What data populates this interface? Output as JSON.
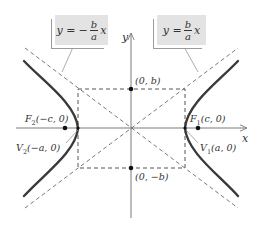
{
  "diagram": {
    "axes": {
      "x_label": "x",
      "y_label": "y"
    },
    "asymptote_labels": {
      "left": {
        "lhs": "y =",
        "sign": "−",
        "numerator": "b",
        "denominator": "a",
        "var": "x"
      },
      "right": {
        "lhs": "y =",
        "sign": "",
        "numerator": "b",
        "denominator": "a",
        "var": "x"
      }
    },
    "points": {
      "co_vertex_top": "(0, b)",
      "co_vertex_bottom": "(0, −b)",
      "focus_right": {
        "name": "F",
        "sub": "1",
        "coords": "(c, 0)"
      },
      "focus_left": {
        "name": "F",
        "sub": "2",
        "coords": "(−c, 0)"
      },
      "vertex_right": {
        "name": "V",
        "sub": "1",
        "coords": "(a, 0)"
      },
      "vertex_left": {
        "name": "V",
        "sub": "2",
        "coords": "(−a, 0)"
      }
    },
    "colors": {
      "curve": "#3a3a3a",
      "axis": "#7a7a7a",
      "dashed": "#555555",
      "box_fill": "#e3e3e3",
      "text": "#333333"
    }
  }
}
